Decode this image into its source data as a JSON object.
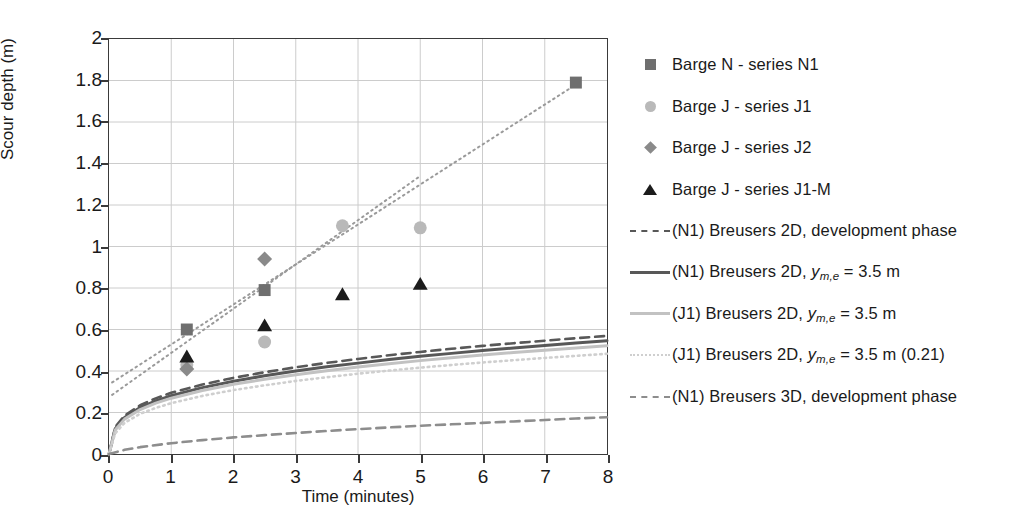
{
  "chart_data": {
    "type": "scatter",
    "title": "",
    "xlabel": "Time (minutes)",
    "ylabel": "Scour depth (m)",
    "xlim": [
      0,
      8
    ],
    "ylim": [
      0,
      2
    ],
    "xticks": [
      "0",
      "1",
      "2",
      "3",
      "4",
      "5",
      "6",
      "7",
      "8"
    ],
    "yticks": [
      "0",
      "0.2",
      "0.4",
      "0.6",
      "0.8",
      "1",
      "1.2",
      "1.4",
      "1.6",
      "1.8",
      "2"
    ],
    "grid": true,
    "legend_position": "right",
    "marker_series": [
      {
        "name": "Barge N - series N1",
        "marker": "square",
        "color": "#6f6f6f",
        "points": [
          [
            1.25,
            0.6
          ],
          [
            2.5,
            0.79
          ],
          [
            7.5,
            1.79
          ]
        ]
      },
      {
        "name": "Barge J - series J1",
        "marker": "circle",
        "color": "#b9b9b9",
        "points": [
          [
            1.25,
            0.43
          ],
          [
            2.5,
            0.54
          ],
          [
            3.75,
            1.1
          ],
          [
            5.0,
            1.09
          ]
        ]
      },
      {
        "name": "Barge J - series J2",
        "marker": "diamond",
        "color": "#8a8a8a",
        "points": [
          [
            1.25,
            0.41
          ],
          [
            2.5,
            0.94
          ]
        ]
      },
      {
        "name": "Barge J - series J1-M",
        "marker": "triangle",
        "color": "#1c1c1c",
        "points": [
          [
            1.25,
            0.47
          ],
          [
            2.5,
            0.62
          ],
          [
            3.75,
            0.77
          ],
          [
            5.0,
            0.82
          ]
        ]
      }
    ],
    "line_series": [
      {
        "name": "(N1) Breusers 2D, development phase",
        "style": "dashed",
        "color": "#585858",
        "width": 2.6,
        "points": [
          [
            0,
            0
          ],
          [
            0.1,
            0.13
          ],
          [
            0.25,
            0.185
          ],
          [
            0.5,
            0.235
          ],
          [
            0.75,
            0.268
          ],
          [
            1.0,
            0.295
          ],
          [
            1.5,
            0.335
          ],
          [
            2.0,
            0.367
          ],
          [
            2.5,
            0.394
          ],
          [
            3.0,
            0.418
          ],
          [
            3.5,
            0.439
          ],
          [
            4.0,
            0.458
          ],
          [
            4.5,
            0.476
          ],
          [
            5.0,
            0.492
          ],
          [
            5.5,
            0.507
          ],
          [
            6.0,
            0.521
          ],
          [
            6.5,
            0.534
          ],
          [
            7.0,
            0.546
          ],
          [
            7.5,
            0.558
          ],
          [
            8.0,
            0.569
          ]
        ]
      },
      {
        "name": "(N1) Breusers 2D, y_m,e = 3.5 m",
        "style": "solid",
        "color": "#585858",
        "width": 3,
        "points": [
          [
            0,
            0
          ],
          [
            0.1,
            0.122
          ],
          [
            0.25,
            0.176
          ],
          [
            0.5,
            0.224
          ],
          [
            0.75,
            0.256
          ],
          [
            1.0,
            0.281
          ],
          [
            1.5,
            0.32
          ],
          [
            2.0,
            0.351
          ],
          [
            2.5,
            0.377
          ],
          [
            3.0,
            0.4
          ],
          [
            3.5,
            0.42
          ],
          [
            4.0,
            0.438
          ],
          [
            4.5,
            0.455
          ],
          [
            5.0,
            0.471
          ],
          [
            5.5,
            0.485
          ],
          [
            6.0,
            0.499
          ],
          [
            6.5,
            0.511
          ],
          [
            7.0,
            0.523
          ],
          [
            7.5,
            0.535
          ],
          [
            8.0,
            0.546
          ]
        ]
      },
      {
        "name": "(J1) Breusers 2D, y_m,e = 3.5 m",
        "style": "solid",
        "color": "#c2c2c2",
        "width": 3,
        "points": [
          [
            0,
            0
          ],
          [
            0.1,
            0.116
          ],
          [
            0.25,
            0.168
          ],
          [
            0.5,
            0.214
          ],
          [
            0.75,
            0.245
          ],
          [
            1.0,
            0.269
          ],
          [
            1.5,
            0.306
          ],
          [
            2.0,
            0.336
          ],
          [
            2.5,
            0.36
          ],
          [
            3.0,
            0.382
          ],
          [
            3.5,
            0.401
          ],
          [
            4.0,
            0.419
          ],
          [
            4.5,
            0.435
          ],
          [
            5.0,
            0.45
          ],
          [
            5.5,
            0.464
          ],
          [
            6.0,
            0.477
          ],
          [
            6.5,
            0.489
          ],
          [
            7.0,
            0.5
          ],
          [
            7.5,
            0.511
          ],
          [
            8.0,
            0.522
          ]
        ]
      },
      {
        "name": "(J1) Breusers 2D, y_m,e = 3.5 m (0.21)",
        "style": "dotted",
        "color": "#cfcfcf",
        "width": 2.6,
        "points": [
          [
            0,
            0
          ],
          [
            0.1,
            0.1
          ],
          [
            0.25,
            0.15
          ],
          [
            0.5,
            0.194
          ],
          [
            0.75,
            0.222
          ],
          [
            1.0,
            0.245
          ],
          [
            1.5,
            0.28
          ],
          [
            2.0,
            0.308
          ],
          [
            2.5,
            0.331
          ],
          [
            3.0,
            0.352
          ],
          [
            3.5,
            0.37
          ],
          [
            4.0,
            0.387
          ],
          [
            4.5,
            0.402
          ],
          [
            5.0,
            0.416
          ],
          [
            5.5,
            0.429
          ],
          [
            6.0,
            0.441
          ],
          [
            6.5,
            0.452
          ],
          [
            7.0,
            0.463
          ],
          [
            7.5,
            0.473
          ],
          [
            8.0,
            0.483
          ]
        ]
      },
      {
        "name": "(N1) Breusers 3D, development phase",
        "style": "dashed",
        "color": "#8d8d8d",
        "width": 2.6,
        "points": [
          [
            0,
            0
          ],
          [
            0.25,
            0.02
          ],
          [
            0.5,
            0.033
          ],
          [
            1.0,
            0.052
          ],
          [
            1.5,
            0.067
          ],
          [
            2.0,
            0.08
          ],
          [
            2.5,
            0.091
          ],
          [
            3.0,
            0.101
          ],
          [
            3.5,
            0.111
          ],
          [
            4.0,
            0.12
          ],
          [
            4.5,
            0.128
          ],
          [
            5.0,
            0.136
          ],
          [
            5.5,
            0.143
          ],
          [
            6.0,
            0.15
          ],
          [
            6.5,
            0.157
          ],
          [
            7.0,
            0.164
          ],
          [
            7.5,
            0.171
          ],
          [
            8.0,
            0.177
          ]
        ]
      },
      {
        "name": "trend-N1",
        "style": "dotted",
        "color": "#9a9a9a",
        "width": 2,
        "points": [
          [
            0.05,
            0.345
          ],
          [
            7.55,
            1.79
          ]
        ]
      },
      {
        "name": "trend-J1",
        "style": "dotted",
        "color": "#9a9a9a",
        "width": 2,
        "points": [
          [
            0.05,
            0.285
          ],
          [
            5.0,
            1.34
          ]
        ]
      }
    ]
  },
  "axes": {
    "y_title": "Scour depth (m)",
    "x_title": "Time (minutes)",
    "yticks": [
      "2",
      "1.8",
      "1.6",
      "1.4",
      "1.2",
      "1",
      "0.8",
      "0.6",
      "0.4",
      "0.2",
      "0"
    ],
    "xticks": [
      "0",
      "1",
      "2",
      "3",
      "4",
      "5",
      "6",
      "7",
      "8"
    ]
  },
  "legend": {
    "items": [
      {
        "key": "square-marker",
        "label": "Barge N - series N1"
      },
      {
        "key": "circle-marker",
        "label": "Barge J - series J1"
      },
      {
        "key": "diamond-marker",
        "label": "Barge J - series J2"
      },
      {
        "key": "triangle-marker",
        "label": "Barge J - series J1-M"
      },
      {
        "key": "dashed-dark-line",
        "label": "(N1) Breusers 2D, development phase"
      },
      {
        "key": "solid-dark-line",
        "label_pre": "(N1) Breusers 2D, ",
        "label_var": "y",
        "label_sub": "m,e",
        "label_post": " = 3.5 m"
      },
      {
        "key": "solid-light-line",
        "label_pre": "(J1) Breusers 2D, ",
        "label_var": "y",
        "label_sub": "m,e",
        "label_post": " = 3.5 m"
      },
      {
        "key": "dotted-light-line",
        "label_pre": "(J1) Breusers 2D, ",
        "label_var": "y",
        "label_sub": "m,e",
        "label_post": " = 3.5 m (0.21)"
      },
      {
        "key": "dashed-mid-line",
        "label": "(N1) Breusers 3D, development phase"
      }
    ]
  },
  "colors": {
    "square": "#6f6f6f",
    "circle": "#b9b9b9",
    "diamond": "#8a8a8a",
    "triangle": "#1c1c1c",
    "frame": "#3a3a3a",
    "grid": "#cccccc",
    "text": "#1a1a1a"
  }
}
